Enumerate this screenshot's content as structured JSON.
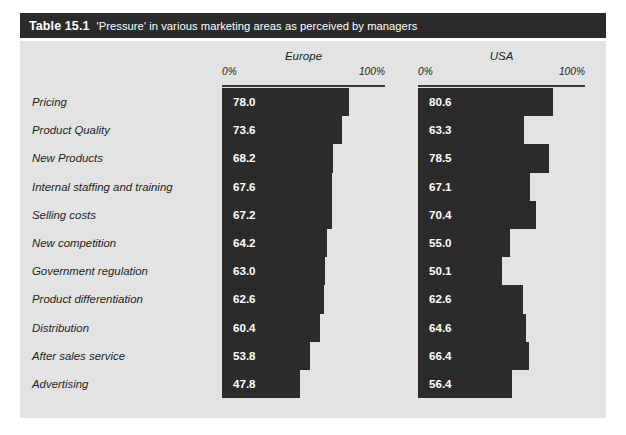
{
  "title": {
    "number": "Table 15.1",
    "caption": "'Pressure' in various marketing areas as perceived by managers"
  },
  "colors": {
    "bar": "#2b2b2b",
    "panel": "#e3e3e3",
    "title_bar": "#2b2b2b",
    "value_text": "#ffffff",
    "label_text": "#1d1d1d"
  },
  "axis": {
    "min_label": "0%",
    "max_label": "100%",
    "min": 0,
    "max": 100
  },
  "chart_data": {
    "type": "bar",
    "title": "'Pressure' in various marketing areas as perceived by managers",
    "xlabel": "",
    "ylabel": "",
    "xlim": [
      0,
      100
    ],
    "grid": false,
    "legend_position": "top",
    "orientation": "horizontal",
    "categories": [
      "Pricing",
      "Product Quality",
      "New Products",
      "Internal staffing and training",
      "Selling costs",
      "New competition",
      "Government regulation",
      "Product differentiation",
      "Distribution",
      "After sales service",
      "Advertising"
    ],
    "series": [
      {
        "name": "Europe",
        "values": [
          78.0,
          73.6,
          68.2,
          67.6,
          67.2,
          64.2,
          63.0,
          62.6,
          60.4,
          53.8,
          47.8
        ],
        "labels": [
          "78.0",
          "73.6",
          "68.2",
          "67.6",
          "67.2",
          "64.2",
          "63.0",
          "62.6",
          "60.4",
          "53.8",
          "47.8"
        ]
      },
      {
        "name": "USA",
        "values": [
          80.6,
          63.3,
          78.5,
          67.1,
          70.4,
          55.0,
          50.1,
          62.6,
          64.6,
          66.4,
          56.4
        ],
        "labels": [
          "80.6",
          "63.3",
          "78.5",
          "67.1",
          "70.4",
          "55.0",
          "50.1",
          "62.6",
          "64.6",
          "66.4",
          "56.4"
        ]
      }
    ]
  }
}
